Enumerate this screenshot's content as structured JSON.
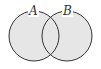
{
  "diagram": {
    "type": "venn",
    "sets": [
      {
        "label": "A",
        "fill": "#e6e6e6",
        "stroke": "#333333"
      },
      {
        "label": "B",
        "fill": "#e6e6e6",
        "stroke": "#333333"
      }
    ],
    "shaded_region": "A ∪ B",
    "background": "#ffffff"
  }
}
